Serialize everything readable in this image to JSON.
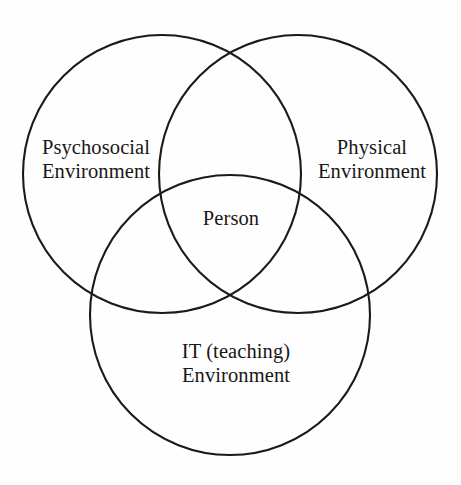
{
  "diagram": {
    "type": "venn-3-set",
    "title": "",
    "background_color": "#fefefe",
    "stroke_color": "#1a1a1a",
    "text_color": "#171717",
    "sets": [
      {
        "id": "psychosocial",
        "label_line1": "Psychosocial",
        "label_line2": "Environment",
        "position": "top-left",
        "center_x": 162,
        "center_y": 174,
        "radius": 139
      },
      {
        "id": "physical",
        "label_line1": "Physical",
        "label_line2": "Environment",
        "position": "top-right",
        "center_x": 298,
        "center_y": 174,
        "radius": 139
      },
      {
        "id": "it_teaching",
        "label_line1": "IT (teaching)",
        "label_line2": "Environment",
        "position": "bottom-center",
        "center_x": 230,
        "center_y": 315,
        "radius": 140
      }
    ],
    "intersection": {
      "id": "person",
      "label": "Person",
      "description": "central triple intersection of all three sets",
      "center_x": 230,
      "center_y": 222
    }
  }
}
